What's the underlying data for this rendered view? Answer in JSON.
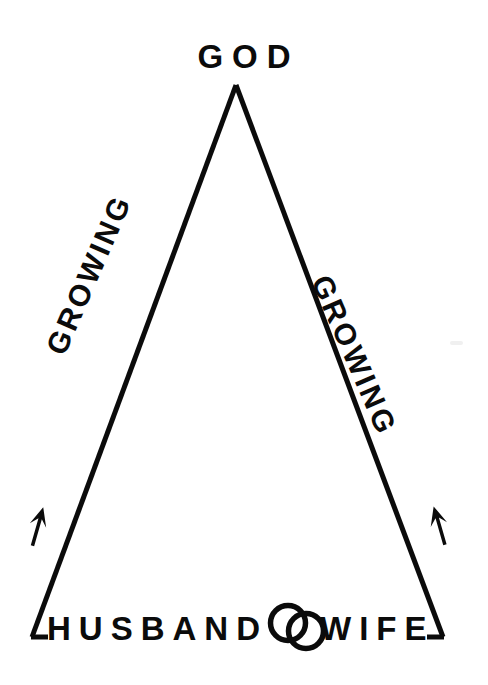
{
  "diagram": {
    "type": "relationship-triangle",
    "title_top": "GOD",
    "base_left": "HUSBAND",
    "base_right": "WIFE",
    "side_left": "GROWING",
    "side_right": "GROWING",
    "rings_symbol": "interlocking-wedding-rings",
    "arrow_left": "upward-arrow",
    "arrow_right": "upward-arrow",
    "colors": {
      "stroke": "#0b0b0b",
      "background": "#ffffff"
    },
    "geometry": {
      "apex": [
        236,
        85
      ],
      "bottom_left": [
        32,
        637
      ],
      "bottom_right": [
        443,
        637
      ],
      "stroke_width": 5
    }
  }
}
